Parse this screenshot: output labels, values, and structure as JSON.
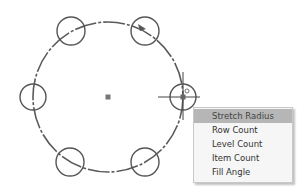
{
  "canvas": {
    "main_circle": {
      "cx": 108,
      "cy": 97,
      "r": 75,
      "color": "#555555"
    },
    "center_marker": {
      "x": 108,
      "y": 97,
      "size": 5,
      "color": "#777777"
    },
    "pattern_circles": [
      {
        "cx": 71,
        "cy": 31,
        "r": 14
      },
      {
        "cx": 145,
        "cy": 31,
        "r": 14
      },
      {
        "cx": 33,
        "cy": 97,
        "r": 13
      },
      {
        "cx": 183,
        "cy": 97,
        "r": 13
      },
      {
        "cx": 70,
        "cy": 162,
        "r": 14
      },
      {
        "cx": 145,
        "cy": 162,
        "r": 14
      }
    ],
    "crosshair": {
      "x": 183,
      "y": 97
    }
  },
  "context_menu": {
    "items": [
      {
        "label": "Stretch Radius",
        "active": true
      },
      {
        "label": "Row Count",
        "active": false
      },
      {
        "label": "Level Count",
        "active": false
      },
      {
        "label": "Item Count",
        "active": false
      },
      {
        "label": "Fill Angle",
        "active": false
      }
    ]
  }
}
